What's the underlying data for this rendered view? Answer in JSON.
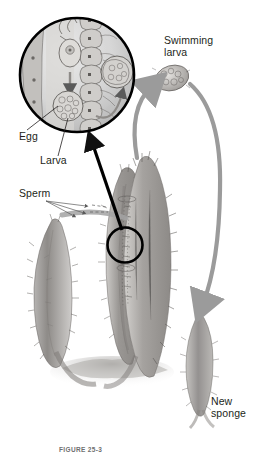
{
  "figure": {
    "title_caption": "FIGURE 25-3",
    "background_color": "#ffffff",
    "ink_color": "#231f20",
    "arrow_gray": "#9b9b9b",
    "tissue_gray": "#8d8d8d"
  },
  "labels": {
    "egg": "Egg",
    "larva": "Larva",
    "sperm": "Sperm",
    "swimming_larva_line1": "Swimming",
    "swimming_larva_line2": "larva",
    "new_sponge_line1": "New",
    "new_sponge_line2": "sponge"
  },
  "elements": {
    "inset_circle": "magnified-tissue-inset",
    "callout_circle": "callout-circle-on-sponge",
    "callout_arrow": "callout-arrow",
    "sperm_arrows": "sperm-arrow-lines",
    "larva_up_arrow": "larva-release-arrow",
    "larva_down_arrow": "larva-settle-arrow",
    "parent_sponge_left": "parent-sponge-left",
    "parent_sponge_center": "parent-sponge-center",
    "parent_sponge_right": "parent-sponge-right",
    "new_sponge": "new-sponge-body",
    "swimming_larva": "swimming-larva-body",
    "substrate": "substrate-base"
  },
  "inset_contents": {
    "epithelium": "choanocyte-layer",
    "egg_cell": "egg-cell",
    "developing_larva": "developing-larva-cluster",
    "released_larva": "released-larva-cluster",
    "sperm_path": "sperm-entry-path"
  }
}
